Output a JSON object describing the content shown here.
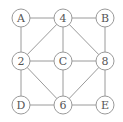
{
  "diagram": {
    "type": "graph",
    "nodes": [
      {
        "id": "A",
        "label": "A",
        "x": 21,
        "y": 18
      },
      {
        "id": "4",
        "label": "4",
        "x": 63,
        "y": 18
      },
      {
        "id": "B",
        "label": "B",
        "x": 105,
        "y": 18
      },
      {
        "id": "2",
        "label": "2",
        "x": 21,
        "y": 61
      },
      {
        "id": "C",
        "label": "C",
        "x": 63,
        "y": 61
      },
      {
        "id": "8",
        "label": "8",
        "x": 105,
        "y": 61
      },
      {
        "id": "D",
        "label": "D",
        "x": 21,
        "y": 105
      },
      {
        "id": "6",
        "label": "6",
        "x": 63,
        "y": 105
      },
      {
        "id": "E",
        "label": "E",
        "x": 105,
        "y": 105
      }
    ],
    "edges": [
      [
        "A",
        "4"
      ],
      [
        "4",
        "B"
      ],
      [
        "A",
        "2"
      ],
      [
        "B",
        "8"
      ],
      [
        "2",
        "C"
      ],
      [
        "C",
        "8"
      ],
      [
        "2",
        "D"
      ],
      [
        "8",
        "E"
      ],
      [
        "D",
        "6"
      ],
      [
        "6",
        "E"
      ],
      [
        "4",
        "C"
      ],
      [
        "C",
        "6"
      ],
      [
        "4",
        "2"
      ],
      [
        "4",
        "8"
      ],
      [
        "2",
        "6"
      ],
      [
        "8",
        "6"
      ]
    ],
    "node_radius": 9,
    "colors": {
      "stroke": "#9a9a9a",
      "text": "#555555",
      "fill": "#ffffff"
    }
  }
}
